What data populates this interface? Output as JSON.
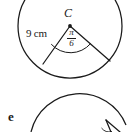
{
  "figure": {
    "type": "geometry-diagram",
    "center_label": "C",
    "radius_label": "9 cm",
    "angle_label": {
      "numerator": "π",
      "denominator": "6"
    },
    "colors": {
      "stroke": "#1a1a1a",
      "background": "#ffffff"
    },
    "geometry": {
      "circle_center": [
        70,
        26
      ],
      "circle_radius": 52,
      "radius_endpoint_left": [
        43,
        64
      ],
      "radius_endpoint_right": [
        110,
        61
      ],
      "angle_arc_radius": 26
    }
  },
  "next_item": {
    "label": "e",
    "description": "Start of the next exercise figure, a circle with an angle marking, cropped at the bottom edge"
  }
}
